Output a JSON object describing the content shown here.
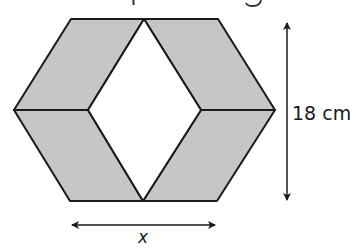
{
  "diagram": {
    "type": "geometry-figure",
    "colors": {
      "shade": "#c6c6c6",
      "stroke": "#1a1a1a",
      "background": "#ffffff"
    },
    "hexagon": {
      "vertices": [
        [
          71,
          19
        ],
        [
          218,
          19
        ],
        [
          275,
          110
        ],
        [
          217,
          201
        ],
        [
          70,
          201
        ],
        [
          14,
          110
        ]
      ],
      "center_top": [
        144,
        19
      ],
      "center_bottom": [
        143,
        201
      ],
      "inner_left": [
        88,
        110
      ],
      "inner_right": [
        201,
        110
      ]
    },
    "shaded_regions": [
      {
        "name": "upper-left-rhombus",
        "points": [
          [
            71,
            19
          ],
          [
            144,
            19
          ],
          [
            88,
            110
          ],
          [
            14,
            110
          ]
        ]
      },
      {
        "name": "upper-right-rhombus",
        "points": [
          [
            144,
            19
          ],
          [
            218,
            19
          ],
          [
            275,
            110
          ],
          [
            201,
            110
          ]
        ]
      },
      {
        "name": "lower-left-rhombus",
        "points": [
          [
            14,
            110
          ],
          [
            88,
            110
          ],
          [
            143,
            201
          ],
          [
            70,
            201
          ]
        ]
      },
      {
        "name": "lower-right-rhombus",
        "points": [
          [
            201,
            110
          ],
          [
            275,
            110
          ],
          [
            217,
            201
          ],
          [
            143,
            201
          ]
        ]
      }
    ],
    "unshaded_region": {
      "name": "central-rhombus",
      "points": [
        [
          144,
          19
        ],
        [
          201,
          110
        ],
        [
          143,
          201
        ],
        [
          88,
          110
        ]
      ]
    },
    "labels": {
      "height": "18 cm",
      "width": "x"
    },
    "dimension_arrows": {
      "height": {
        "x": 287,
        "y1": 21,
        "y2": 202
      },
      "width": {
        "y": 225,
        "x1": 70,
        "x2": 217
      }
    }
  }
}
